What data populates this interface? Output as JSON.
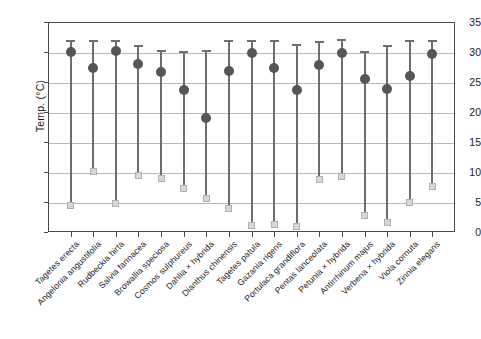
{
  "chart_data": {
    "type": "scatter",
    "title": "",
    "subtitle": "",
    "xlabel": "",
    "ylabel": "Temp. (°C)",
    "ylim": [
      0,
      35
    ],
    "yticks": [
      0,
      5,
      10,
      15,
      20,
      25,
      30,
      35
    ],
    "ytick_labels": [
      "0",
      "5",
      "10",
      "15",
      "20",
      "25",
      "30",
      "35"
    ],
    "grid": "horizontal",
    "legend": "none",
    "series_names": [
      "Minimum",
      "Mean",
      "Maximum"
    ],
    "marker_styles": {
      "minimum": "light-gray-square",
      "mean": "dark-gray-circle",
      "maximum": "line-cap"
    },
    "categories": [
      "Tagetes erecta",
      "Angelonia angustifolia",
      "Rudbeckia hirta",
      "Salvia farinacea",
      "Browallia speciosa",
      "Cosmos sulphureus",
      "Dahlia × hybrida",
      "Dianthus chinensis",
      "Tagetes patula",
      "Gazania rigens",
      "Portulaca grandiflora",
      "Pentas lanceolata",
      "Petunia × hybrida",
      "Antirrhinum majus",
      "Verbena × hybrida",
      "Viola cornuta",
      "Zinnia elegans"
    ],
    "series": [
      {
        "name": "Minimum",
        "values": [
          4.5,
          10.1,
          4.8,
          9.4,
          9.0,
          7.2,
          5.6,
          3.9,
          1.1,
          1.2,
          0.9,
          8.8,
          9.2,
          2.7,
          1.6,
          5.0,
          7.6
        ]
      },
      {
        "name": "Mean",
        "values": [
          30.0,
          27.3,
          30.1,
          28.0,
          26.7,
          23.6,
          19.0,
          26.8,
          29.8,
          27.4,
          23.7,
          27.8,
          29.8,
          25.5,
          23.9,
          26.0,
          29.7
        ]
      },
      {
        "name": "Maximum",
        "values": [
          32.0,
          32.0,
          32.0,
          31.2,
          30.3,
          30.2,
          30.3,
          32.0,
          32.0,
          32.0,
          31.3,
          31.9,
          32.1,
          30.2,
          31.2,
          32.0,
          32.0
        ]
      }
    ],
    "colors": {
      "mean_marker": "#555555",
      "min_marker": "#d8d8d8",
      "range_line": "#6e6e6e",
      "gridline": "#b9b9b9",
      "axis": "#4a4a4a",
      "background": "#ffffff"
    }
  }
}
